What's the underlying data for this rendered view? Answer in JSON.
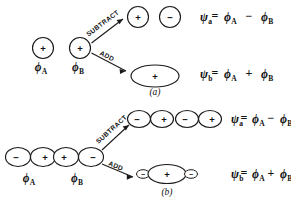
{
  "figure": {
    "background_color": "#ffffff",
    "ink_color": "#1a1a1a",
    "panels": [
      {
        "id": "a",
        "caption": "(a)",
        "orbital_type": "s",
        "inputs": [
          {
            "label_phi": "ϕ",
            "label_sub": "A",
            "lobes": [
              {
                "sign": "+"
              }
            ]
          },
          {
            "label_phi": "ϕ",
            "label_sub": "B",
            "lobes": [
              {
                "sign": "+"
              }
            ]
          }
        ],
        "operations": [
          {
            "name": "subtract",
            "caption": "SUBTRACT"
          },
          {
            "name": "add",
            "caption": "ADD"
          }
        ],
        "results": [
          {
            "name": "antibonding",
            "lobes": [
              {
                "sign": "+"
              },
              {
                "sign": "−"
              }
            ],
            "psi": "ψ",
            "psi_sub": "a",
            "equals": "=",
            "term_1": "ϕ",
            "term_1_sub": "A",
            "operator": "−",
            "term_2": "ϕ",
            "term_2_sub": "B"
          },
          {
            "name": "bonding",
            "lobes": [
              {
                "sign": "+"
              }
            ],
            "psi": "ψ",
            "psi_sub": "b",
            "equals": "=",
            "term_1": "ϕ",
            "term_1_sub": "A",
            "operator": "+",
            "term_2": "ϕ",
            "term_2_sub": "B"
          }
        ]
      },
      {
        "id": "b",
        "caption": "(b)",
        "orbital_type": "p",
        "inputs": [
          {
            "label_phi": "ϕ",
            "label_sub": "A",
            "lobes": [
              {
                "sign": "−"
              },
              {
                "sign": "+"
              }
            ]
          },
          {
            "label_phi": "ϕ",
            "label_sub": "B",
            "lobes": [
              {
                "sign": "+"
              },
              {
                "sign": "−"
              }
            ]
          }
        ],
        "operations": [
          {
            "name": "subtract",
            "caption": "SUBTRACT"
          },
          {
            "name": "add",
            "caption": "ADD"
          }
        ],
        "results": [
          {
            "name": "antibonding",
            "lobes": [
              {
                "sign": "−"
              },
              {
                "sign": "+"
              },
              {
                "sign": "−"
              },
              {
                "sign": "+"
              }
            ],
            "psi": "ψ",
            "psi_sub": "a",
            "equals": "=",
            "term_1": "ϕ",
            "term_1_sub": "A",
            "operator": "−",
            "term_2": "ϕ",
            "term_2_sub": "B"
          },
          {
            "name": "bonding",
            "lobes": [
              {
                "sign": "−"
              },
              {
                "sign": "+"
              },
              {
                "sign": "−"
              }
            ],
            "psi": "ψ",
            "psi_sub": "b",
            "equals": "=",
            "term_1": "ϕ",
            "term_1_sub": "A",
            "operator": "+",
            "term_2": "ϕ",
            "term_2_sub": "B"
          }
        ]
      }
    ]
  }
}
